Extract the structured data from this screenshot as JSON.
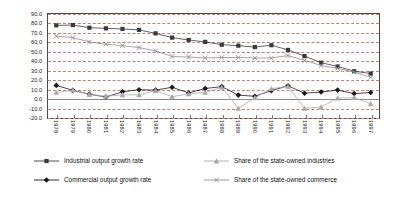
{
  "chart_data": {
    "type": "line",
    "title": "",
    "subtitle": "",
    "xlabel": "",
    "ylabel": "",
    "ylim": [
      -20.0,
      90.0
    ],
    "ytick_step": 10.0,
    "grid": true,
    "grid_style": "dashed-horizontal",
    "legend_position": "bottom",
    "legend_columns": 2,
    "categories": [
      "1978",
      "1979",
      "1980",
      "1981",
      "1982",
      "1983",
      "1984",
      "1985",
      "1986",
      "1987",
      "1988",
      "1989",
      "1990",
      "1991",
      "1992",
      "1993",
      "1994",
      "1995",
      "1996",
      "1997"
    ],
    "ytick_labels": [
      "90.0",
      "80.0",
      "70.0",
      "60.0",
      "50.0",
      "40.0",
      "30.0",
      "20.0",
      "10.0",
      "0.0",
      "-10.0",
      "-20.0"
    ],
    "series": [
      {
        "name": "Industrial output growth rate",
        "marker": "square",
        "color": "#3a3a3a",
        "values": [
          78.0,
          78.3,
          75.5,
          74.8,
          74.2,
          73.2,
          69.5,
          65.0,
          62.5,
          60.5,
          57.5,
          56.5,
          55.0,
          57.0,
          52.0,
          45.5,
          38.5,
          34.5,
          29.5,
          27.0
        ]
      },
      {
        "name": "Commercial output growth rate",
        "marker": "diamond",
        "color": "#1a1a1a",
        "values": [
          14.5,
          9.3,
          5.2,
          2.2,
          7.7,
          9.9,
          9.5,
          12.5,
          6.5,
          11.2,
          13.2,
          4.2,
          3.0,
          9.0,
          14.0,
          6.2,
          7.5,
          9.5,
          5.8,
          7.0
        ]
      },
      {
        "name": "Share of the state-owned industries",
        "marker": "triangle",
        "color": "#a9a9a9",
        "values": [
          7.0,
          9.5,
          5.0,
          3.0,
          4.5,
          4.5,
          9.0,
          2.5,
          5.5,
          7.0,
          12.5,
          -9.8,
          1.5,
          11.0,
          13.5,
          -9.8,
          -8.5,
          1.0,
          1.5,
          -5.0
        ]
      },
      {
        "name": "Share of the state-owned commerce",
        "marker": "x",
        "color": "#8e8e8e",
        "values": [
          66.5,
          65.0,
          60.5,
          58.0,
          56.5,
          54.5,
          51.0,
          45.0,
          44.5,
          43.5,
          44.0,
          44.0,
          43.5,
          43.5,
          46.0,
          41.0,
          35.5,
          32.5,
          28.5,
          23.0
        ]
      }
    ]
  },
  "legend": {
    "items": [
      {
        "label": "Industrial output growth rate",
        "marker": "square"
      },
      {
        "label": "Commercial output growth rate",
        "marker": "diamond"
      },
      {
        "label": "Share of the state-owned industries",
        "marker": "triangle"
      },
      {
        "label": "Share of the state-owned commerce",
        "marker": "x"
      }
    ]
  }
}
